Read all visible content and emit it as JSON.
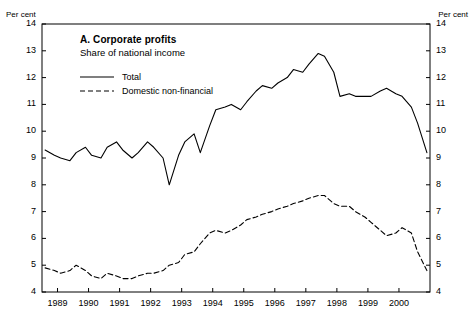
{
  "axis": {
    "unit_left": "Per cent",
    "unit_right": "Per cent",
    "y_ticks": [
      "14",
      "13",
      "12",
      "11",
      "10",
      "9",
      "8",
      "7",
      "6",
      "5",
      "4"
    ],
    "x_ticks": [
      "1989",
      "1990",
      "1991",
      "1992",
      "1993",
      "1994",
      "1995",
      "1996",
      "1997",
      "1998",
      "1999",
      "2000"
    ]
  },
  "titles": {
    "panel": "A. Corporate profits",
    "subtitle": "Share of national income"
  },
  "legend": [
    {
      "label": "Total",
      "style": "solid"
    },
    {
      "label": "Domestic non-financial",
      "style": "dashed"
    }
  ],
  "chart_data": {
    "type": "line",
    "title": "A. Corporate profits",
    "subtitle": "Share of national income",
    "xlabel": "",
    "ylabel": "Per cent",
    "ylim": [
      4,
      14
    ],
    "xlim": [
      1988.5,
      2001.0
    ],
    "ytick_step": 1,
    "grid": false,
    "legend_position": "upper-left-inside",
    "x_tick_values": [
      1989,
      1990,
      1991,
      1992,
      1993,
      1994,
      1995,
      1996,
      1997,
      1998,
      1999,
      2000
    ],
    "series": [
      {
        "name": "Total",
        "style": "solid",
        "color": "#000000",
        "x": [
          1988.6,
          1988.9,
          1989.1,
          1989.4,
          1989.6,
          1989.9,
          1990.1,
          1990.4,
          1990.6,
          1990.9,
          1991.1,
          1991.4,
          1991.6,
          1991.9,
          1992.1,
          1992.4,
          1992.6,
          1992.9,
          1993.1,
          1993.4,
          1993.6,
          1993.9,
          1994.1,
          1994.4,
          1994.6,
          1994.9,
          1995.1,
          1995.4,
          1995.6,
          1995.9,
          1996.1,
          1996.4,
          1996.6,
          1996.9,
          1997.1,
          1997.4,
          1997.6,
          1997.9,
          1998.1,
          1998.4,
          1998.6,
          1998.9,
          1999.1,
          1999.4,
          1999.6,
          1999.9,
          2000.1,
          2000.4,
          2000.6,
          2000.9
        ],
        "y": [
          9.3,
          9.1,
          9.0,
          8.9,
          9.2,
          9.4,
          9.1,
          9.0,
          9.4,
          9.6,
          9.3,
          9.0,
          9.2,
          9.6,
          9.4,
          9.0,
          8.0,
          9.1,
          9.6,
          9.9,
          9.2,
          10.2,
          10.8,
          10.9,
          11.0,
          10.8,
          11.1,
          11.5,
          11.7,
          11.6,
          11.8,
          12.0,
          12.3,
          12.2,
          12.5,
          12.9,
          12.8,
          12.2,
          11.3,
          11.4,
          11.3,
          11.3,
          11.3,
          11.5,
          11.6,
          11.4,
          11.3,
          10.9,
          10.3,
          9.2
        ]
      },
      {
        "name": "Domestic non-financial",
        "style": "dashed",
        "color": "#000000",
        "x": [
          1988.6,
          1988.9,
          1989.1,
          1989.4,
          1989.6,
          1989.9,
          1990.1,
          1990.4,
          1990.6,
          1990.9,
          1991.1,
          1991.4,
          1991.6,
          1991.9,
          1992.1,
          1992.4,
          1992.6,
          1992.9,
          1993.1,
          1993.4,
          1993.6,
          1993.9,
          1994.1,
          1994.4,
          1994.6,
          1994.9,
          1995.1,
          1995.4,
          1995.6,
          1995.9,
          1996.1,
          1996.4,
          1996.6,
          1996.9,
          1997.1,
          1997.4,
          1997.6,
          1997.9,
          1998.1,
          1998.4,
          1998.6,
          1998.9,
          1999.1,
          1999.4,
          1999.6,
          1999.9,
          2000.1,
          2000.4,
          2000.6,
          2000.9
        ],
        "y": [
          4.9,
          4.8,
          4.7,
          4.8,
          5.0,
          4.8,
          4.6,
          4.5,
          4.7,
          4.6,
          4.5,
          4.5,
          4.6,
          4.7,
          4.7,
          4.8,
          5.0,
          5.1,
          5.4,
          5.5,
          5.8,
          6.2,
          6.3,
          6.2,
          6.3,
          6.5,
          6.7,
          6.8,
          6.9,
          7.0,
          7.1,
          7.2,
          7.3,
          7.4,
          7.5,
          7.6,
          7.6,
          7.3,
          7.2,
          7.2,
          7.0,
          6.8,
          6.6,
          6.3,
          6.1,
          6.2,
          6.4,
          6.2,
          5.5,
          4.8
        ]
      }
    ]
  }
}
